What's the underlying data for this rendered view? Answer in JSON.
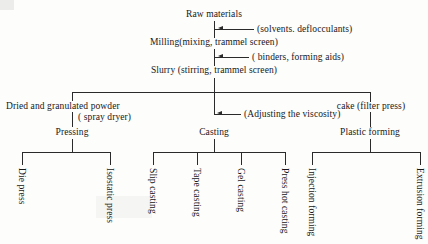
{
  "diagram": {
    "nodes": {
      "raw_materials": "Raw materials",
      "additive_1": "(solvents. deflocculants)",
      "milling": "Milling(mixing, trammel screen)",
      "additive_2": "( binders, forming aids)",
      "slurry": "Slurry (stirring, trammel screen)",
      "dried_powder": "Dried and granulated powder",
      "spray_dryer": "( spray dryer)",
      "viscosity": "(Adjusting the viscosity)",
      "cake": "cake (filter press)",
      "pressing": "Pressing",
      "casting": "Casting",
      "plastic_forming": "Plastic forming"
    },
    "leaves": {
      "die_press": "Die press",
      "isostatic_press": "Isostatic press",
      "slip_casting": "Slip casting",
      "tape_casting": "Tape casting",
      "gel_casting": "Gel casting",
      "press_hot_casting": "Press hot casting",
      "injection_forming": "Injection forming",
      "extrusion_forming": "Extrusion forming"
    },
    "colors": {
      "line": "#2a2a2a",
      "text": "#17171a",
      "background": "#fdfdfb"
    }
  }
}
